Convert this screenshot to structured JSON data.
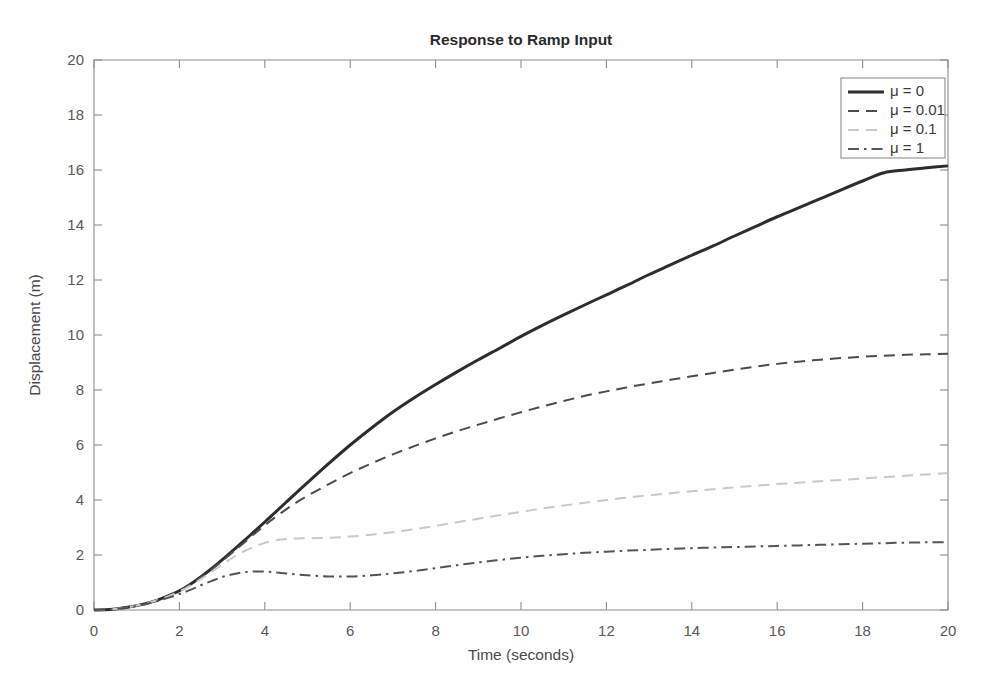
{
  "figure": {
    "background_color": "#ffffff",
    "axis_color": "#8d8d8d",
    "title": "Response to Ramp Input"
  },
  "chart_data": {
    "type": "line",
    "title": "Response to Ramp Input",
    "xlabel": "Time (seconds)",
    "ylabel": "Displacement (m)",
    "xlim": [
      0,
      20
    ],
    "ylim": [
      0,
      20
    ],
    "xticks": [
      0,
      2,
      4,
      6,
      8,
      10,
      12,
      14,
      16,
      18,
      20
    ],
    "yticks": [
      0,
      2,
      4,
      6,
      8,
      10,
      12,
      14,
      16,
      18,
      20
    ],
    "xticklabels": [
      "0",
      "2",
      "4",
      "6",
      "8",
      "10",
      "12",
      "14",
      "16",
      "18",
      "20"
    ],
    "yticklabels": [
      "0",
      "2",
      "4",
      "6",
      "8",
      "10",
      "12",
      "14",
      "16",
      "18",
      "20"
    ],
    "grid": false,
    "legend_position": "upper right",
    "x": [
      0,
      0.25,
      0.5,
      0.75,
      1,
      1.25,
      1.5,
      1.75,
      2,
      2.25,
      2.5,
      2.75,
      3,
      3.25,
      3.5,
      3.75,
      4,
      4.25,
      4.5,
      4.75,
      5,
      5.5,
      6,
      6.5,
      7,
      7.5,
      8,
      8.5,
      9,
      9.5,
      10,
      10.5,
      11,
      11.5,
      12,
      12.5,
      13,
      13.5,
      14,
      14.5,
      15,
      15.5,
      16,
      16.5,
      17,
      17.5,
      18,
      18.5,
      19,
      19.5,
      20
    ],
    "series": [
      {
        "name": "mu-0",
        "label": "μ = 0",
        "color": "#2d2d2d",
        "linestyle": "solid",
        "linewidth": 3.0,
        "values": [
          0,
          0.01,
          0.04,
          0.09,
          0.16,
          0.25,
          0.37,
          0.52,
          0.7,
          0.93,
          1.2,
          1.5,
          1.82,
          2.16,
          2.5,
          2.85,
          3.2,
          3.56,
          3.92,
          4.28,
          4.63,
          5.33,
          6.0,
          6.62,
          7.2,
          7.72,
          8.2,
          8.66,
          9.1,
          9.52,
          9.95,
          10.35,
          10.73,
          11.1,
          11.46,
          11.82,
          12.2,
          12.55,
          12.9,
          13.24,
          13.6,
          13.95,
          14.3,
          14.62,
          14.95,
          15.28,
          15.6,
          15.9,
          16.0,
          16.08,
          16.15
        ]
      },
      {
        "name": "mu-0-01",
        "label": "μ = 0.01",
        "color": "#4c4c4c",
        "linestyle": "dashed",
        "linewidth": 2.0,
        "values": [
          0,
          0.01,
          0.04,
          0.09,
          0.16,
          0.25,
          0.37,
          0.52,
          0.7,
          0.92,
          1.18,
          1.47,
          1.78,
          2.1,
          2.43,
          2.76,
          3.08,
          3.38,
          3.66,
          3.92,
          4.15,
          4.58,
          4.98,
          5.33,
          5.66,
          5.96,
          6.24,
          6.5,
          6.74,
          6.97,
          7.19,
          7.4,
          7.6,
          7.79,
          7.95,
          8.1,
          8.24,
          8.37,
          8.5,
          8.62,
          8.74,
          8.85,
          8.95,
          9.03,
          9.1,
          9.16,
          9.21,
          9.25,
          9.28,
          9.3,
          9.32
        ]
      },
      {
        "name": "mu-0-1",
        "label": "μ = 0.1",
        "color": "#c9c9c9",
        "linestyle": "dashed",
        "linewidth": 2.0,
        "values": [
          0,
          0.01,
          0.04,
          0.09,
          0.16,
          0.25,
          0.37,
          0.5,
          0.67,
          0.88,
          1.12,
          1.38,
          1.65,
          1.9,
          2.12,
          2.3,
          2.44,
          2.53,
          2.58,
          2.6,
          2.61,
          2.63,
          2.67,
          2.74,
          2.83,
          2.94,
          3.06,
          3.19,
          3.32,
          3.45,
          3.57,
          3.69,
          3.8,
          3.9,
          4.0,
          4.09,
          4.17,
          4.25,
          4.32,
          4.39,
          4.46,
          4.52,
          4.58,
          4.63,
          4.68,
          4.73,
          4.78,
          4.83,
          4.88,
          4.93,
          4.98
        ]
      },
      {
        "name": "mu-1",
        "label": "μ = 1",
        "color": "#555555",
        "linestyle": "dashdot",
        "linewidth": 2.0,
        "values": [
          0,
          0.01,
          0.04,
          0.09,
          0.15,
          0.23,
          0.33,
          0.45,
          0.58,
          0.73,
          0.9,
          1.05,
          1.2,
          1.3,
          1.37,
          1.4,
          1.4,
          1.37,
          1.33,
          1.29,
          1.26,
          1.22,
          1.22,
          1.26,
          1.33,
          1.42,
          1.52,
          1.63,
          1.73,
          1.82,
          1.9,
          1.97,
          2.03,
          2.08,
          2.12,
          2.16,
          2.19,
          2.22,
          2.25,
          2.27,
          2.29,
          2.31,
          2.33,
          2.35,
          2.37,
          2.39,
          2.41,
          2.43,
          2.45,
          2.46,
          2.47
        ]
      }
    ]
  },
  "legend": {
    "entries": [
      {
        "label": "μ = 0"
      },
      {
        "label": "μ = 0.01"
      },
      {
        "label": "μ = 0.1"
      },
      {
        "label": "μ = 1"
      }
    ]
  }
}
